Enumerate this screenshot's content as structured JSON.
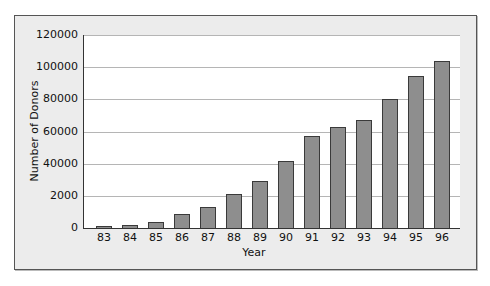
{
  "chart_data": {
    "type": "bar",
    "title": "",
    "xlabel": "Year",
    "ylabel": "Number of Donors",
    "categories": [
      "83",
      "84",
      "85",
      "86",
      "87",
      "88",
      "89",
      "90",
      "91",
      "92",
      "93",
      "94",
      "95",
      "96"
    ],
    "values": [
      1200,
      2000,
      3800,
      9000,
      12800,
      21400,
      29400,
      41700,
      57400,
      63000,
      67200,
      80000,
      94500,
      104000
    ],
    "ylim": [
      0,
      120000
    ],
    "yticks": [
      0,
      20000,
      40000,
      60000,
      80000,
      100000,
      120000
    ],
    "ytick_labels": [
      "0",
      "2000",
      "40000",
      "60000",
      "80000",
      "100000",
      "120000"
    ],
    "grid": true,
    "legend": null,
    "colors": {
      "bar_fill": "#8e8e8e",
      "bar_edge": "#3a3a3a",
      "panel_bg": "#ececec",
      "plot_bg": "#ffffff",
      "grid": "#b5b5b5"
    }
  }
}
